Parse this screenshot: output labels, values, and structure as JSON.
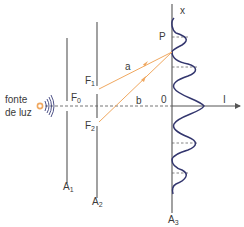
{
  "diagram": {
    "source_label_line1": "fonte",
    "source_label_line2": "de luz",
    "slit_labels": {
      "f0": "F",
      "f0_sub": "0",
      "f1": "F",
      "f1_sub": "1",
      "f2": "F",
      "f2_sub": "2"
    },
    "barrier_labels": {
      "a1": "A",
      "a1_sub": "1",
      "a2": "A",
      "a2_sub": "2",
      "a3": "A",
      "a3_sub": "3"
    },
    "ray_labels": {
      "a": "a",
      "b": "b"
    },
    "axis_labels": {
      "x": "x",
      "intensity": "I",
      "origin": "0",
      "point": "P"
    },
    "colors": {
      "lines": "#555555",
      "rays": "#f0a860",
      "source": "#f0a860",
      "wavefronts": "#3b3f7a",
      "intensity_curve": "#33366e",
      "dashed": "#666666"
    }
  }
}
